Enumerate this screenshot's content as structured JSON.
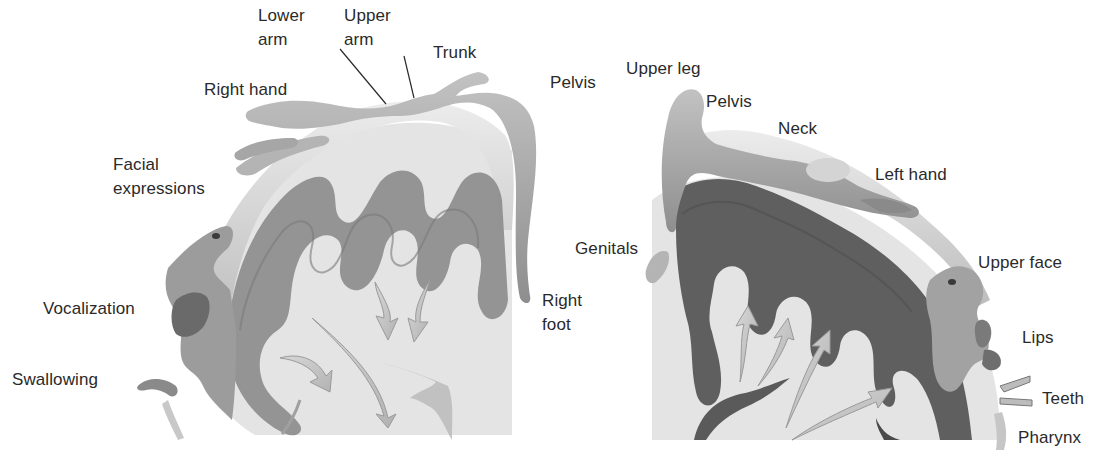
{
  "figure": {
    "type": "anatomical diagram",
    "colors": {
      "background": "#ffffff",
      "text": "#2a2a2a",
      "cortex_fill": "#e6e6e6",
      "motor_gyri": "#8c8c8c",
      "sensory_gyri": "#5e5e5e",
      "body_parts": "#a8a8a8",
      "arrows": "#c4c4c4"
    }
  },
  "left_panel": {
    "labels": [
      {
        "id": "lower-arm",
        "line1": "Lower",
        "line2": "arm"
      },
      {
        "id": "upper-arm",
        "line1": "Upper",
        "line2": "arm"
      },
      {
        "id": "trunk",
        "text": "Trunk"
      },
      {
        "id": "pelvis",
        "text": "Pelvis"
      },
      {
        "id": "right-hand",
        "text": "Right hand"
      },
      {
        "id": "facial-expressions",
        "line1": "Facial",
        "line2": "expressions"
      },
      {
        "id": "vocalization",
        "text": "Vocalization"
      },
      {
        "id": "swallowing",
        "text": "Swallowing"
      },
      {
        "id": "right-foot",
        "line1": "Right",
        "line2": "foot"
      }
    ]
  },
  "right_panel": {
    "labels": [
      {
        "id": "upper-leg",
        "text": "Upper leg"
      },
      {
        "id": "pelvis",
        "text": "Pelvis"
      },
      {
        "id": "neck",
        "text": "Neck"
      },
      {
        "id": "left-hand",
        "text": "Left hand"
      },
      {
        "id": "genitals",
        "text": "Genitals"
      },
      {
        "id": "upper-face",
        "text": "Upper face"
      },
      {
        "id": "lips",
        "text": "Lips"
      },
      {
        "id": "teeth",
        "text": "Teeth"
      },
      {
        "id": "pharynx",
        "text": "Pharynx"
      }
    ]
  }
}
